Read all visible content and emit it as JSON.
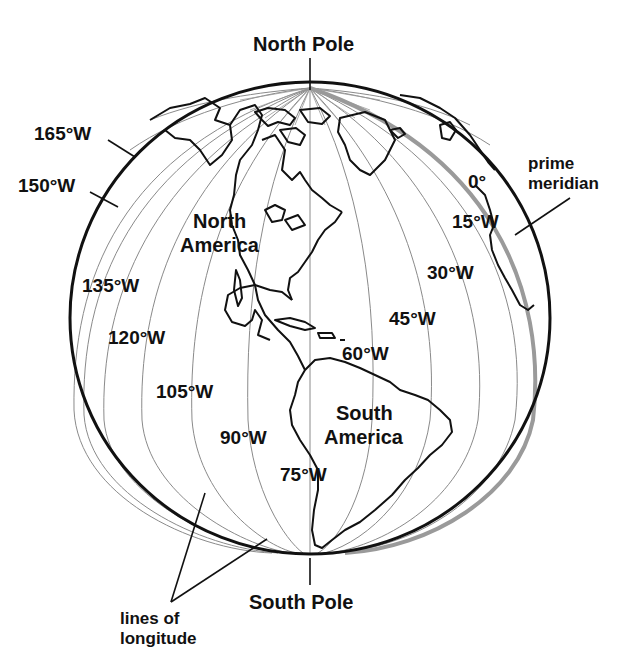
{
  "poles": {
    "north": "North Pole",
    "south": "South Pole"
  },
  "continents": {
    "north_america_line1": "North",
    "north_america_line2": "America",
    "south_america_line1": "South",
    "south_america_line2": "America"
  },
  "callouts": {
    "prime_meridian_line1": "prime",
    "prime_meridian_line2": "meridian",
    "lines_of_longitude_line1": "lines of",
    "lines_of_longitude_line2": "longitude"
  },
  "meridians": [
    {
      "label": "0°",
      "lon": 0
    },
    {
      "label": "15°W",
      "lon": -15
    },
    {
      "label": "30°W",
      "lon": -30
    },
    {
      "label": "45°W",
      "lon": -45
    },
    {
      "label": "60°W",
      "lon": -60
    },
    {
      "label": "75°W",
      "lon": -75
    },
    {
      "label": "90°W",
      "lon": -90
    },
    {
      "label": "105°W",
      "lon": -105
    },
    {
      "label": "120°W",
      "lon": -120
    },
    {
      "label": "135°W",
      "lon": -135
    },
    {
      "label": "150°W",
      "lon": -150
    },
    {
      "label": "165°W",
      "lon": -165
    }
  ],
  "colors": {
    "outline": "#111111",
    "meridian": "#8a8a8a",
    "prime_meridian": "#9a9a9a",
    "coastline": "#111111",
    "background": "#ffffff"
  }
}
